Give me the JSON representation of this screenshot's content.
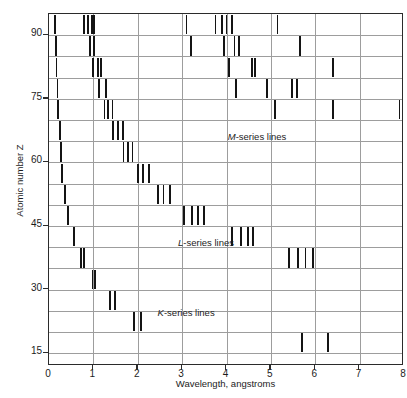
{
  "figure": {
    "caption_fragment_top": "illi",
    "caption_fragment_bottom": "e of"
  },
  "axes": {
    "x_title": "Wavelength, angstroms",
    "y_title": "Atomic number Z",
    "x_ticks": [
      "0",
      "1",
      "2",
      "3",
      "4",
      "5",
      "6",
      "7",
      "8"
    ],
    "y_ticks": [
      "90",
      "75",
      "60",
      "45",
      "30",
      "15"
    ]
  },
  "annotations": [
    {
      "name": "m-series-label",
      "prefix": "M",
      "text": "-series lines",
      "x": 4.05,
      "y": 65.5
    },
    {
      "name": "l-series-label",
      "prefix": "L",
      "text": "-series lines",
      "x": 2.93,
      "y": 40.5
    },
    {
      "name": "k-series-label",
      "prefix": "K",
      "text": "-series lines",
      "x": 2.47,
      "y": 24.0
    }
  ],
  "chart_data": {
    "type": "scatter",
    "xlabel": "Wavelength, angstroms",
    "ylabel": "Atomic number Z",
    "xlim": [
      0,
      8
    ],
    "ylim": [
      12,
      95
    ],
    "grid": true,
    "legend": "none",
    "x_ticks": [
      0,
      1,
      2,
      3,
      4,
      5,
      6,
      7,
      8
    ],
    "y_ticks": [
      90,
      75,
      60,
      45,
      30,
      15
    ],
    "y_gridlines": [
      15,
      20,
      25,
      30,
      35,
      40,
      45,
      50,
      55,
      60,
      65,
      70,
      75,
      80,
      85,
      90
    ],
    "x_gridlines": [
      1,
      2,
      3,
      4,
      5,
      6,
      7
    ],
    "mark_style": "vertical tick marks spanning one Z-band (~5 Z units)",
    "rows": [
      {
        "band_label": "Z 90-95",
        "z_center": 92.5,
        "z_lo": 90.0,
        "z_hi": 95.0,
        "wavelengths": [
          0.13,
          0.78,
          0.88,
          0.97,
          1.02,
          3.1,
          3.75,
          3.9,
          4.0,
          4.13,
          5.15
        ]
      },
      {
        "band_label": "Z 85-90",
        "z_center": 87.5,
        "z_lo": 85.0,
        "z_hi": 90.0,
        "wavelengths": [
          0.15,
          0.93,
          1.02,
          3.2,
          3.95,
          4.18,
          4.28,
          5.65
        ]
      },
      {
        "band_label": "Z 80-85",
        "z_center": 82.5,
        "z_lo": 80.0,
        "z_hi": 85.0,
        "wavelengths": [
          0.17,
          1.0,
          1.1,
          1.17,
          4.05,
          4.57,
          4.65,
          6.4
        ]
      },
      {
        "band_label": "Z 75-80",
        "z_center": 77.5,
        "z_lo": 75.0,
        "z_hi": 80.0,
        "wavelengths": [
          0.19,
          1.13,
          1.28,
          4.22,
          4.92,
          5.48,
          5.58
        ]
      },
      {
        "band_label": "Z 70-75",
        "z_center": 72.5,
        "z_lo": 70.0,
        "z_hi": 75.0,
        "wavelengths": [
          0.21,
          1.25,
          1.33,
          1.43,
          5.1,
          6.4,
          7.9
        ]
      },
      {
        "band_label": "Z 65-70",
        "z_center": 67.5,
        "z_lo": 65.0,
        "z_hi": 70.0,
        "wavelengths": [
          0.24,
          1.45,
          1.55,
          1.66
        ]
      },
      {
        "band_label": "Z 60-65",
        "z_center": 62.5,
        "z_lo": 60.0,
        "z_hi": 65.0,
        "wavelengths": [
          0.27,
          1.68,
          1.78,
          1.88
        ]
      },
      {
        "band_label": "Z 55-60",
        "z_center": 57.5,
        "z_lo": 55.0,
        "z_hi": 60.0,
        "wavelengths": [
          0.3,
          2.0,
          2.12,
          2.26
        ]
      },
      {
        "band_label": "Z 50-55",
        "z_center": 52.5,
        "z_lo": 50.0,
        "z_hi": 55.0,
        "wavelengths": [
          0.36,
          2.45,
          2.58,
          2.72
        ]
      },
      {
        "band_label": "Z 45-50",
        "z_center": 47.5,
        "z_lo": 45.0,
        "z_hi": 50.0,
        "wavelengths": [
          0.43,
          3.05,
          3.22,
          3.36,
          3.5
        ]
      },
      {
        "band_label": "Z 40-45",
        "z_center": 42.5,
        "z_lo": 40.0,
        "z_hi": 45.0,
        "wavelengths": [
          0.56,
          4.12,
          4.32,
          4.48,
          4.6
        ]
      },
      {
        "band_label": "Z 35-40",
        "z_center": 37.5,
        "z_lo": 35.0,
        "z_hi": 40.0,
        "wavelengths": [
          0.72,
          0.78,
          5.4,
          5.62,
          5.78,
          5.95
        ]
      },
      {
        "band_label": "Z 30-35",
        "z_center": 32.5,
        "z_lo": 30.0,
        "z_hi": 35.0,
        "wavelengths": [
          0.98,
          1.04
        ]
      },
      {
        "band_label": "Z 25-30",
        "z_center": 27.5,
        "z_lo": 25.0,
        "z_hi": 30.0,
        "wavelengths": [
          1.38,
          1.48
        ]
      },
      {
        "band_label": "Z 20-25",
        "z_center": 22.5,
        "z_lo": 20.0,
        "z_hi": 25.0,
        "wavelengths": [
          1.92,
          2.08
        ]
      },
      {
        "band_label": "Z 15-20",
        "z_center": 17.5,
        "z_lo": 15.0,
        "z_hi": 20.0,
        "wavelengths": [
          5.7,
          6.28
        ]
      }
    ]
  }
}
